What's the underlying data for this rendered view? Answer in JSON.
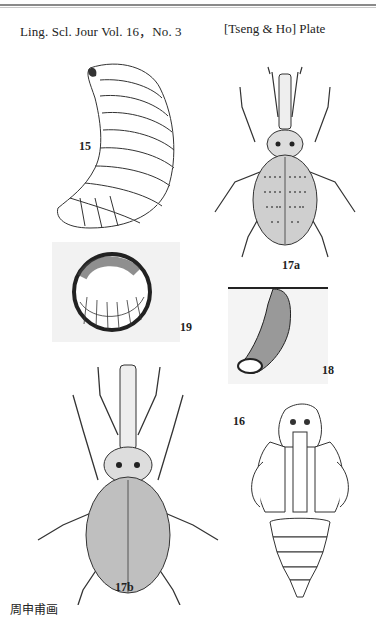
{
  "header": {
    "journal": "Ling. Scl. Jour Vol. 16，No. 3",
    "authors_plate": "[Tseng & Ho] Plate"
  },
  "figures": [
    {
      "id": "15",
      "label": "15",
      "subject": "larva (curved grub, lateral view)"
    },
    {
      "id": "17a",
      "label": "17a",
      "subject": "adult weevil, dorsal view"
    },
    {
      "id": "19",
      "label": "19",
      "subject": "larva curled inside soil cell"
    },
    {
      "id": "18",
      "label": "18",
      "subject": "pupal chamber / burrow in soil"
    },
    {
      "id": "17b",
      "label": "17b",
      "subject": "adult weevil, dorsal view"
    },
    {
      "id": "16",
      "label": "16",
      "subject": "pupa, ventral view"
    }
  ],
  "signature": "周申甫画",
  "colors": {
    "ink": "#222222",
    "paper": "#ffffff",
    "rule": "#8a8a8a"
  }
}
